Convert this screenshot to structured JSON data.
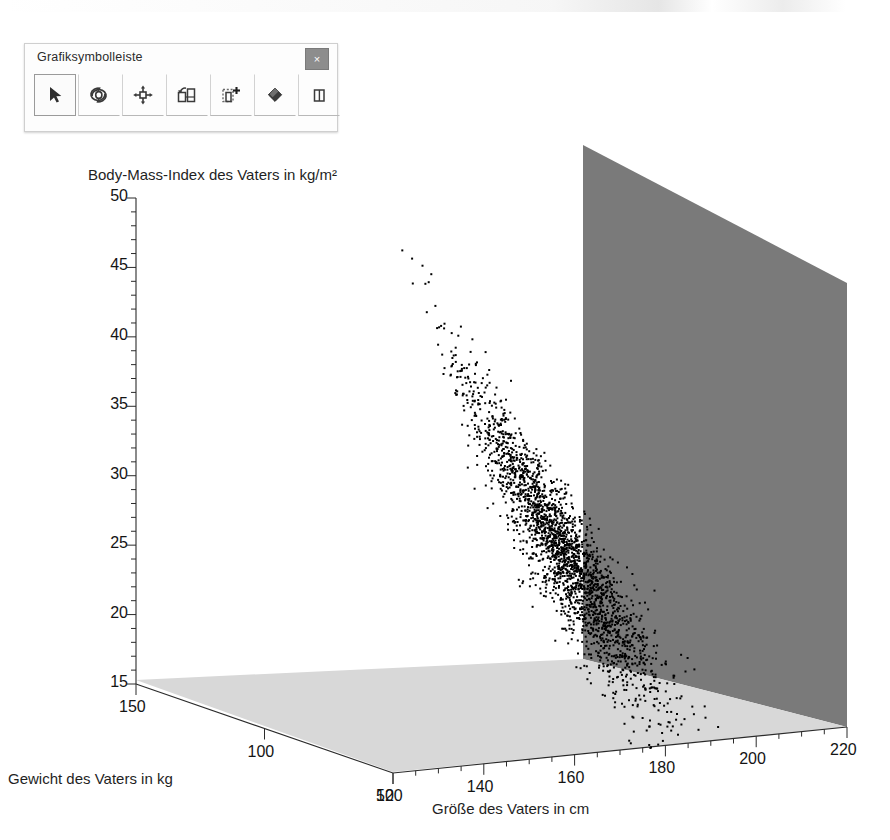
{
  "window": {
    "toolbar": {
      "title": "Grafiksymbolleiste",
      "close_label": "×",
      "buttons": [
        {
          "name": "select-arrow",
          "icon": "arrow-pointer-icon",
          "selected": true
        },
        {
          "name": "rotate",
          "icon": "rotate-icon",
          "selected": false
        },
        {
          "name": "pan-move",
          "icon": "move-arrows-icon",
          "selected": false
        },
        {
          "name": "reorder-objects",
          "icon": "swap-objects-icon",
          "selected": false
        },
        {
          "name": "add-element",
          "icon": "add-element-icon",
          "selected": false
        },
        {
          "name": "erase",
          "icon": "eraser-icon",
          "selected": false
        },
        {
          "name": "show-panel",
          "icon": "panel-icon",
          "selected": false
        }
      ]
    }
  },
  "chart_data": {
    "type": "scatter",
    "projection": "3d",
    "title": "Body-Mass-Index des Vaters in kg/m²",
    "zlabel": "Body-Mass-Index des Vaters in kg/m²",
    "xlabel": "Größe des Vaters in cm",
    "ylabel": "Gewicht des Vaters in kg",
    "grid": false,
    "legend": null,
    "z_axis": {
      "label": "Body-Mass-Index des Vaters in kg/m²",
      "ticks": [
        50,
        45,
        40,
        35,
        30,
        25,
        20,
        15
      ],
      "tick_labels": [
        "50",
        "45",
        "40",
        "35",
        "30",
        "25",
        "20",
        "15"
      ],
      "minor_ticks_per_interval": 4,
      "range": [
        15,
        50
      ]
    },
    "x_axis": {
      "label": "Größe des Vaters in cm",
      "ticks": [
        120,
        140,
        160,
        180,
        200,
        220
      ],
      "tick_labels": [
        "120",
        "140",
        "160",
        "180",
        "200",
        "220"
      ],
      "minor_ticks_per_interval": 4,
      "range": [
        120,
        220
      ]
    },
    "y_axis": {
      "label": "Gewicht des Vaters in kg",
      "ticks": [
        150,
        100,
        50
      ],
      "tick_labels": [
        "150",
        "100",
        "50"
      ],
      "reversed": true,
      "range": [
        50,
        150
      ]
    },
    "point_count": 2400,
    "point_color": "#000000",
    "point_size_px": 2,
    "panes": {
      "back_wall_color": "#7a7a7a",
      "floor_color": "#d8d8d8",
      "background_color": "#ffffff"
    }
  }
}
